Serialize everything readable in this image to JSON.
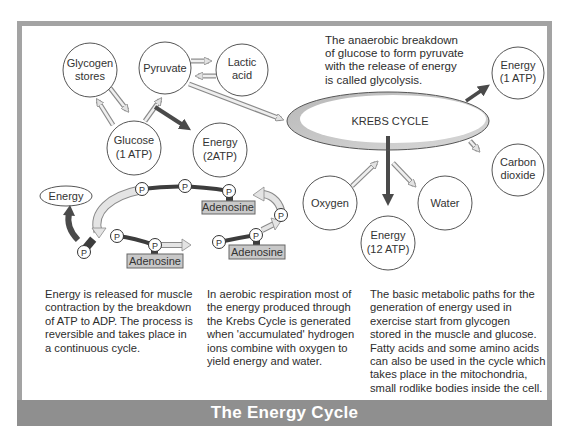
{
  "title": "The Energy Cycle",
  "colors": {
    "frame": "#a3a3a3",
    "footer_band": "#8f8f8f",
    "footer_text": "#ffffff",
    "dark_arrow": "#4a4a4a",
    "light_arrow_fill": "#dcdcdc",
    "adenosine_box": "#c8c8c8",
    "krebs_shadow": "#c4c4c4"
  },
  "glycolysis_note": [
    "The anaerobic breakdown",
    "of glucose to form pyruvate",
    "with the release of energy",
    "is called glycolysis."
  ],
  "nodes": {
    "glycogen": [
      "Glycogen",
      "stores"
    ],
    "pyruvate": [
      "Pyruvate"
    ],
    "lactic": [
      "Lactic",
      "acid"
    ],
    "glucose": [
      "Glucose",
      "(1 ATP)"
    ],
    "energy2": [
      "Energy",
      "(2ATP)"
    ],
    "krebs": "KREBS CYCLE",
    "energy1": [
      "Energy",
      "(1 ATP)"
    ],
    "co2": [
      "Carbon",
      "dioxide"
    ],
    "oxygen": [
      "Oxygen"
    ],
    "water": [
      "Water"
    ],
    "energy12": [
      "Energy",
      "(12 ATP)"
    ]
  },
  "atp_diagram": {
    "energy_label": "Energy",
    "phosphate": "P",
    "adenosine": "Adenosine"
  },
  "paragraphs": {
    "atp": [
      "Energy is released for muscle",
      "contraction by the breakdown",
      "of ATP to ADP. The process is",
      "reversible and takes place in",
      "a continuous cycle."
    ],
    "aerobic": [
      "In aerobic respiration most of",
      "the energy produced through",
      "the Krebs Cycle is generated",
      "when 'accumulated' hydrogen",
      "ions combine with oxygen to",
      "yield energy and water."
    ],
    "metabolic": [
      "The basic metabolic paths for the",
      "generation of energy used in",
      "exercise start from glycogen",
      "stored in the muscle and glucose.",
      "Fatty acids and some amino acids",
      "can also be used in the cycle which",
      "takes place in the mitochondria,",
      "small rodlike bodies inside the cell."
    ]
  }
}
